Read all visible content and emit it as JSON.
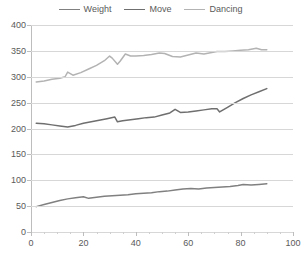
{
  "chart_data": {
    "type": "line",
    "title": "",
    "xlabel": "",
    "ylabel": "",
    "xlim": [
      0,
      100
    ],
    "ylim": [
      0,
      400
    ],
    "x_ticks": [
      0,
      20,
      40,
      60,
      80,
      100
    ],
    "y_ticks": [
      0,
      50,
      100,
      150,
      200,
      250,
      300,
      350,
      400
    ],
    "grid": true,
    "legend_position": "top-center",
    "series": [
      {
        "name": "Weight",
        "color": "#808080",
        "x": [
          2,
          5,
          8,
          11,
          14,
          17,
          20,
          22,
          25,
          28,
          31,
          34,
          37,
          40,
          43,
          46,
          49,
          52,
          55,
          58,
          61,
          64,
          67,
          70,
          73,
          76,
          79,
          81,
          84,
          87,
          90
        ],
        "values": [
          49,
          53,
          57,
          61,
          64,
          66,
          68,
          65,
          67,
          69,
          70,
          71,
          72,
          74,
          75,
          76,
          78,
          79,
          81,
          83,
          84,
          83,
          85,
          86,
          87,
          88,
          90,
          92,
          91,
          92,
          93
        ]
      },
      {
        "name": "Move",
        "color": "#6f6f6f",
        "x": [
          2,
          5,
          8,
          11,
          14,
          17,
          20,
          23,
          26,
          29,
          32,
          33,
          35,
          38,
          41,
          44,
          47,
          50,
          53,
          55,
          57,
          60,
          63,
          66,
          69,
          71,
          72,
          75,
          78,
          81,
          84,
          87,
          90
        ],
        "values": [
          210,
          209,
          207,
          205,
          203,
          206,
          210,
          213,
          216,
          219,
          222,
          213,
          215,
          217,
          219,
          221,
          222,
          226,
          230,
          237,
          231,
          232,
          234,
          236,
          238,
          238,
          232,
          241,
          250,
          258,
          265,
          271,
          277
        ]
      },
      {
        "name": "Dancing",
        "color": "#b3b3b3",
        "x": [
          2,
          5,
          8,
          11,
          13,
          14,
          16,
          19,
          22,
          25,
          28,
          30,
          31,
          33,
          34,
          36,
          38,
          40,
          43,
          46,
          49,
          51,
          54,
          57,
          60,
          63,
          66,
          69,
          71,
          74,
          77,
          80,
          83,
          86,
          88,
          90
        ],
        "values": [
          290,
          292,
          295,
          297,
          300,
          309,
          303,
          308,
          315,
          322,
          331,
          340,
          336,
          324,
          330,
          344,
          340,
          340,
          341,
          343,
          346,
          345,
          339,
          338,
          342,
          346,
          344,
          347,
          349,
          349,
          350,
          351,
          352,
          355,
          352,
          352
        ]
      }
    ]
  },
  "legend": {
    "items": [
      {
        "label": "Weight"
      },
      {
        "label": "Move"
      },
      {
        "label": "Dancing"
      }
    ]
  }
}
